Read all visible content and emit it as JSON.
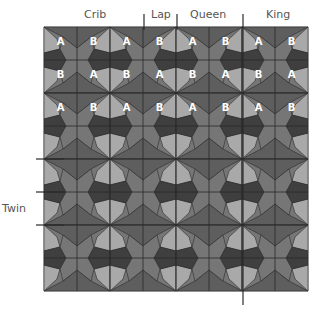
{
  "size_labels": {
    "crib": "Crib",
    "lap": "Lap",
    "queen": "Queen",
    "king": "King",
    "twin": "Twin"
  },
  "grid": {
    "rows": 8,
    "cols": 8,
    "cell_size": 33,
    "origin": [
      44,
      27
    ]
  },
  "block_labels": [
    [
      "A",
      "B",
      "A",
      "B",
      "A",
      "B",
      "A",
      "B"
    ],
    [
      "B",
      "A",
      "B",
      "A",
      "B",
      "A",
      "B",
      "A"
    ],
    [
      "A",
      "B",
      "A",
      "B",
      "A",
      "B",
      "A",
      "B"
    ]
  ],
  "colors": {
    "light": "#a9a9a9",
    "mid": "#767676",
    "mid_dark": "#5e5e5e",
    "dark": "#3f3f3f",
    "line": "#2a2a2a",
    "label_text": "#ffffff"
  }
}
